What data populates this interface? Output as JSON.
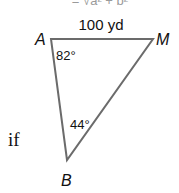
{
  "formula_fragment": "= √a² + b²",
  "side_label": "100 yd",
  "vertices": {
    "A": "A",
    "M": "M",
    "B": "B"
  },
  "angles": {
    "A": "82°",
    "B": "44°"
  },
  "prose_fragment": "if",
  "colors": {
    "line": "#6b6b6b",
    "text": "#111111",
    "faded": "#9a9a9a"
  }
}
